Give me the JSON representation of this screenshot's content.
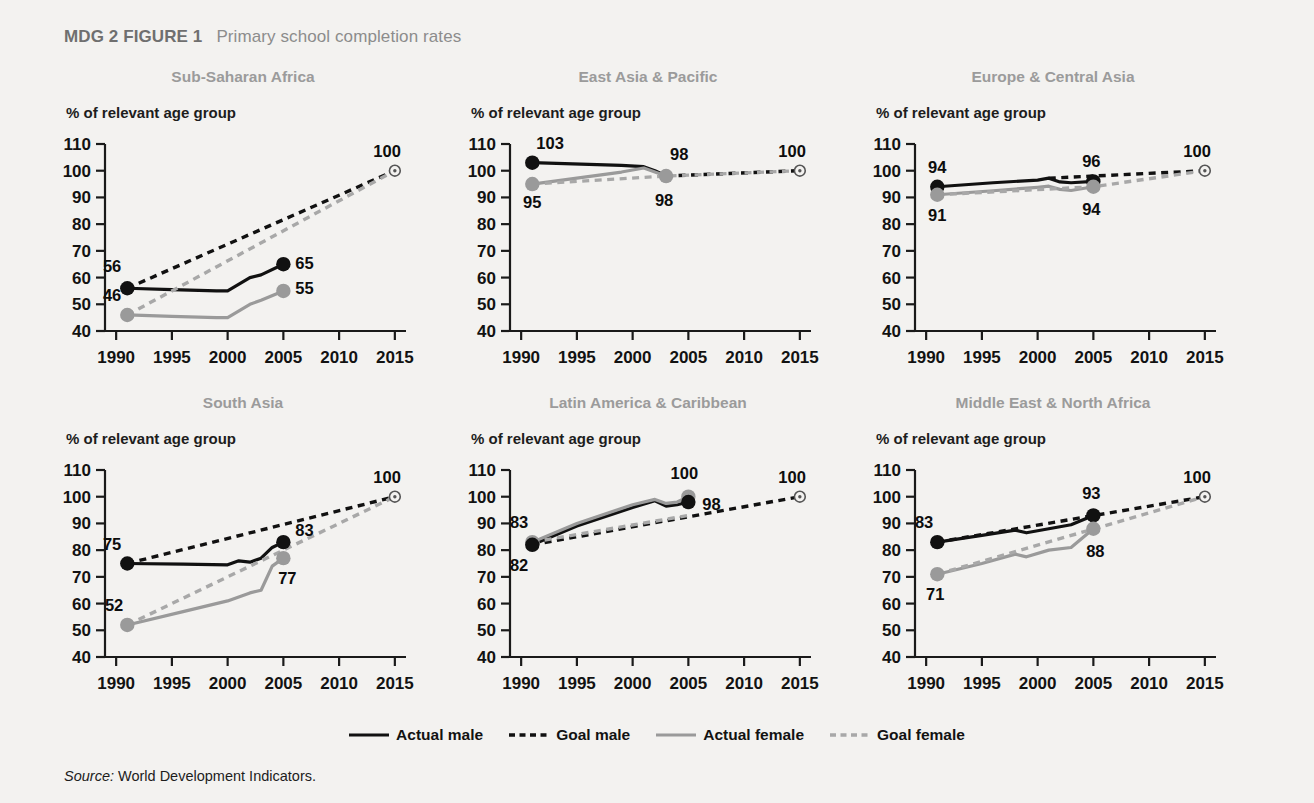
{
  "figure": {
    "number_label": "MDG 2 FIGURE 1",
    "title": "Primary school completion rates"
  },
  "source": {
    "label": "Source:",
    "text": "World Development Indicators."
  },
  "legend": {
    "position": "bottom-center",
    "items": [
      {
        "label": "Actual male",
        "color": "#111111",
        "style": "solid"
      },
      {
        "label": "Goal male",
        "color": "#111111",
        "style": "dashed"
      },
      {
        "label": "Actual female",
        "color": "#9a9a9a",
        "style": "solid"
      },
      {
        "label": "Goal female",
        "color": "#a8a8a8",
        "style": "dashed"
      }
    ]
  },
  "axes": {
    "ylabel": "% of relevant age group",
    "yticks": [
      110,
      100,
      90,
      80,
      70,
      60,
      50,
      40
    ],
    "ylim": [
      40,
      110
    ],
    "xticks": [
      1990,
      1995,
      2000,
      2005,
      2010,
      2015
    ],
    "xlim": [
      1989,
      2016
    ],
    "grid": false
  },
  "chart_data": [
    {
      "type": "line",
      "title": "Sub-Saharan Africa",
      "xlabel": "",
      "ylabel": "% of relevant age group",
      "ylim": [
        40,
        110
      ],
      "xlim": [
        1989,
        2016
      ],
      "series": [
        {
          "name": "Actual male",
          "style": "solid",
          "color": "#111111",
          "x": [
            1991,
            1995,
            1999,
            2000,
            2002,
            2003,
            2005
          ],
          "y": [
            56,
            55.5,
            55,
            55,
            60,
            61,
            65
          ]
        },
        {
          "name": "Goal male",
          "style": "dashed",
          "color": "#111111",
          "x": [
            1991,
            2015
          ],
          "y": [
            56,
            100
          ]
        },
        {
          "name": "Actual female",
          "style": "solid",
          "color": "#9a9a9a",
          "x": [
            1991,
            1995,
            1999,
            2000,
            2002,
            2003,
            2005
          ],
          "y": [
            46,
            45.5,
            45,
            45,
            50,
            51.5,
            55
          ]
        },
        {
          "name": "Goal female",
          "style": "dashed",
          "color": "#a8a8a8",
          "x": [
            1991,
            2015
          ],
          "y": [
            46,
            100
          ]
        }
      ],
      "point_labels": [
        {
          "text": "56",
          "x": 1991,
          "y": 56,
          "dx": -6,
          "dy": -16,
          "anchor": "end"
        },
        {
          "text": "65",
          "x": 2005,
          "y": 65,
          "dx": 12,
          "dy": 5,
          "anchor": "start"
        },
        {
          "text": "46",
          "x": 1991,
          "y": 46,
          "dx": -6,
          "dy": -14,
          "anchor": "end"
        },
        {
          "text": "55",
          "x": 2005,
          "y": 55,
          "dx": 12,
          "dy": 3,
          "anchor": "start"
        },
        {
          "text": "100",
          "x": 2015,
          "y": 100,
          "dx": 6,
          "dy": -14,
          "anchor": "end"
        }
      ],
      "markers": [
        {
          "x": 1991,
          "y": 56,
          "color": "#111111",
          "kind": "filled"
        },
        {
          "x": 2005,
          "y": 65,
          "color": "#111111",
          "kind": "filled"
        },
        {
          "x": 1991,
          "y": 46,
          "color": "#9a9a9a",
          "kind": "filled"
        },
        {
          "x": 2005,
          "y": 55,
          "color": "#9a9a9a",
          "kind": "filled"
        },
        {
          "x": 2015,
          "y": 100,
          "color": "#555555",
          "kind": "target"
        }
      ]
    },
    {
      "type": "line",
      "title": "East Asia & Pacific",
      "xlabel": "",
      "ylabel": "% of relevant age group",
      "ylim": [
        40,
        110
      ],
      "xlim": [
        1989,
        2016
      ],
      "series": [
        {
          "name": "Actual male",
          "style": "solid",
          "color": "#111111",
          "x": [
            1991,
            1999,
            2001,
            2002,
            2003
          ],
          "y": [
            103,
            102,
            101.5,
            100,
            98
          ]
        },
        {
          "name": "Goal male",
          "style": "dashed",
          "color": "#111111",
          "x": [
            2003,
            2015
          ],
          "y": [
            98,
            100
          ]
        },
        {
          "name": "Actual female",
          "style": "solid",
          "color": "#9a9a9a",
          "x": [
            1991,
            1999,
            2001,
            2003
          ],
          "y": [
            95,
            99.5,
            101,
            98
          ]
        },
        {
          "name": "Goal female",
          "style": "dashed",
          "color": "#a8a8a8",
          "x": [
            1991,
            2003,
            2015
          ],
          "y": [
            95,
            98,
            100
          ]
        }
      ],
      "point_labels": [
        {
          "text": "103",
          "x": 1991,
          "y": 103,
          "dx": 4,
          "dy": -14,
          "anchor": "start"
        },
        {
          "text": "95",
          "x": 1991,
          "y": 95,
          "dx": 0,
          "dy": 24,
          "anchor": "middle"
        },
        {
          "text": "98",
          "x": 2003,
          "y": 101,
          "dx": 4,
          "dy": -8,
          "anchor": "start"
        },
        {
          "text": "98",
          "x": 2003,
          "y": 98,
          "dx": -2,
          "dy": 30,
          "anchor": "middle"
        },
        {
          "text": "100",
          "x": 2015,
          "y": 100,
          "dx": 6,
          "dy": -14,
          "anchor": "end"
        }
      ],
      "markers": [
        {
          "x": 1991,
          "y": 103,
          "color": "#111111",
          "kind": "filled"
        },
        {
          "x": 1991,
          "y": 95,
          "color": "#9a9a9a",
          "kind": "filled"
        },
        {
          "x": 2003,
          "y": 98,
          "color": "#9a9a9a",
          "kind": "filled"
        },
        {
          "x": 2015,
          "y": 100,
          "color": "#555555",
          "kind": "target"
        }
      ]
    },
    {
      "type": "line",
      "title": "Europe & Central Asia",
      "xlabel": "",
      "ylabel": "% of relevant age group",
      "ylim": [
        40,
        110
      ],
      "xlim": [
        1989,
        2016
      ],
      "series": [
        {
          "name": "Actual male",
          "style": "solid",
          "color": "#111111",
          "x": [
            1991,
            1996,
            2000,
            2001,
            2002,
            2003,
            2005
          ],
          "y": [
            94,
            95.5,
            96.5,
            97.2,
            95.8,
            95.5,
            96
          ]
        },
        {
          "name": "Goal male",
          "style": "dashed",
          "color": "#111111",
          "x": [
            2001,
            2015
          ],
          "y": [
            97.2,
            100
          ]
        },
        {
          "name": "Actual female",
          "style": "solid",
          "color": "#9a9a9a",
          "x": [
            1991,
            1996,
            2000,
            2001,
            2002,
            2003,
            2005
          ],
          "y": [
            91,
            92.5,
            93.8,
            94.2,
            93,
            92.6,
            94
          ]
        },
        {
          "name": "Goal female",
          "style": "dashed",
          "color": "#a8a8a8",
          "x": [
            1991,
            2005,
            2015
          ],
          "y": [
            91,
            94,
            100
          ]
        }
      ],
      "point_labels": [
        {
          "text": "94",
          "x": 1991,
          "y": 94,
          "dx": 0,
          "dy": -14,
          "anchor": "middle"
        },
        {
          "text": "91",
          "x": 1991,
          "y": 91,
          "dx": 0,
          "dy": 26,
          "anchor": "middle"
        },
        {
          "text": "96",
          "x": 2005,
          "y": 96,
          "dx": -2,
          "dy": -14,
          "anchor": "middle"
        },
        {
          "text": "94",
          "x": 2005,
          "y": 94,
          "dx": -2,
          "dy": 28,
          "anchor": "middle"
        },
        {
          "text": "100",
          "x": 2015,
          "y": 100,
          "dx": 6,
          "dy": -14,
          "anchor": "end"
        }
      ],
      "markers": [
        {
          "x": 1991,
          "y": 94,
          "color": "#111111",
          "kind": "filled"
        },
        {
          "x": 1991,
          "y": 91,
          "color": "#9a9a9a",
          "kind": "filled"
        },
        {
          "x": 2005,
          "y": 96,
          "color": "#111111",
          "kind": "filled"
        },
        {
          "x": 2005,
          "y": 94,
          "color": "#9a9a9a",
          "kind": "filled"
        },
        {
          "x": 2015,
          "y": 100,
          "color": "#555555",
          "kind": "target"
        }
      ]
    },
    {
      "type": "line",
      "title": "South Asia",
      "xlabel": "",
      "ylabel": "% of relevant age group",
      "ylim": [
        40,
        110
      ],
      "xlim": [
        1989,
        2016
      ],
      "series": [
        {
          "name": "Actual male",
          "style": "solid",
          "color": "#111111",
          "x": [
            1991,
            1996,
            2000,
            2001,
            2002,
            2003,
            2004,
            2005
          ],
          "y": [
            75,
            74.8,
            74.5,
            76,
            75.5,
            77,
            81,
            83
          ]
        },
        {
          "name": "Goal male",
          "style": "dashed",
          "color": "#111111",
          "x": [
            1991,
            2015
          ],
          "y": [
            75,
            100
          ]
        },
        {
          "name": "Actual female",
          "style": "solid",
          "color": "#9a9a9a",
          "x": [
            1991,
            1996,
            2000,
            2002,
            2003,
            2004,
            2005
          ],
          "y": [
            52,
            57,
            61,
            64,
            65,
            74,
            77
          ]
        },
        {
          "name": "Goal female",
          "style": "dashed",
          "color": "#a8a8a8",
          "x": [
            1991,
            2015
          ],
          "y": [
            52,
            100
          ]
        }
      ],
      "point_labels": [
        {
          "text": "75",
          "x": 1991,
          "y": 75,
          "dx": -6,
          "dy": -14,
          "anchor": "end"
        },
        {
          "text": "52",
          "x": 1991,
          "y": 52,
          "dx": -4,
          "dy": -14,
          "anchor": "end"
        },
        {
          "text": "83",
          "x": 2005,
          "y": 83,
          "dx": 12,
          "dy": -6,
          "anchor": "start"
        },
        {
          "text": "77",
          "x": 2005,
          "y": 77,
          "dx": 4,
          "dy": 26,
          "anchor": "middle"
        },
        {
          "text": "100",
          "x": 2015,
          "y": 100,
          "dx": 6,
          "dy": -14,
          "anchor": "end"
        }
      ],
      "markers": [
        {
          "x": 1991,
          "y": 75,
          "color": "#111111",
          "kind": "filled"
        },
        {
          "x": 2005,
          "y": 83,
          "color": "#111111",
          "kind": "filled"
        },
        {
          "x": 1991,
          "y": 52,
          "color": "#9a9a9a",
          "kind": "filled"
        },
        {
          "x": 2005,
          "y": 77,
          "color": "#9a9a9a",
          "kind": "filled"
        },
        {
          "x": 2015,
          "y": 100,
          "color": "#555555",
          "kind": "target"
        }
      ]
    },
    {
      "type": "line",
      "title": "Latin America & Caribbean",
      "xlabel": "",
      "ylabel": "% of relevant age group",
      "ylim": [
        40,
        110
      ],
      "xlim": [
        1989,
        2016
      ],
      "series": [
        {
          "name": "Actual male",
          "style": "solid",
          "color": "#111111",
          "x": [
            1991,
            1995,
            2000,
            2002,
            2003,
            2004,
            2005
          ],
          "y": [
            82,
            89,
            96,
            98.5,
            96.5,
            97,
            98
          ]
        },
        {
          "name": "Goal male",
          "style": "dashed",
          "color": "#111111",
          "x": [
            1991,
            2015
          ],
          "y": [
            82,
            100
          ]
        },
        {
          "name": "Actual female",
          "style": "solid",
          "color": "#9a9a9a",
          "x": [
            1991,
            1995,
            2000,
            2002,
            2003,
            2004,
            2005
          ],
          "y": [
            83,
            90,
            97,
            99,
            97.5,
            98,
            100
          ]
        },
        {
          "name": "Goal female",
          "style": "dashed",
          "color": "#a8a8a8",
          "x": [
            1991,
            2005
          ],
          "y": [
            83,
            93
          ]
        }
      ],
      "point_labels": [
        {
          "text": "83",
          "x": 1991,
          "y": 83,
          "dx": -4,
          "dy": -14,
          "anchor": "end"
        },
        {
          "text": "82",
          "x": 1991,
          "y": 82,
          "dx": -4,
          "dy": 26,
          "anchor": "end"
        },
        {
          "text": "100",
          "x": 2005,
          "y": 100,
          "dx": -4,
          "dy": -18,
          "anchor": "middle"
        },
        {
          "text": "98",
          "x": 2005,
          "y": 98,
          "dx": 14,
          "dy": 8,
          "anchor": "start"
        },
        {
          "text": "100",
          "x": 2015,
          "y": 100,
          "dx": 6,
          "dy": -14,
          "anchor": "end"
        }
      ],
      "markers": [
        {
          "x": 1991,
          "y": 83,
          "color": "#9a9a9a",
          "kind": "filled"
        },
        {
          "x": 1991,
          "y": 82,
          "color": "#111111",
          "kind": "filled"
        },
        {
          "x": 2005,
          "y": 100,
          "color": "#9a9a9a",
          "kind": "filled"
        },
        {
          "x": 2005,
          "y": 98,
          "color": "#111111",
          "kind": "filled"
        },
        {
          "x": 2015,
          "y": 100,
          "color": "#555555",
          "kind": "target"
        }
      ]
    },
    {
      "type": "line",
      "title": "Middle East & North Africa",
      "xlabel": "",
      "ylabel": "% of relevant age group",
      "ylim": [
        40,
        110
      ],
      "xlim": [
        1989,
        2016
      ],
      "series": [
        {
          "name": "Actual male",
          "style": "solid",
          "color": "#111111",
          "x": [
            1991,
            1995,
            1998,
            1999,
            2001,
            2003,
            2005
          ],
          "y": [
            83,
            85.5,
            87.5,
            86.5,
            88,
            89.5,
            93
          ]
        },
        {
          "name": "Goal male",
          "style": "dashed",
          "color": "#111111",
          "x": [
            1991,
            2015
          ],
          "y": [
            83,
            100
          ]
        },
        {
          "name": "Actual female",
          "style": "solid",
          "color": "#9a9a9a",
          "x": [
            1991,
            1995,
            1998,
            1999,
            2001,
            2003,
            2005
          ],
          "y": [
            71,
            75,
            78.5,
            77.5,
            80,
            81,
            88
          ]
        },
        {
          "name": "Goal female",
          "style": "dashed",
          "color": "#a8a8a8",
          "x": [
            1991,
            2015
          ],
          "y": [
            71,
            100
          ]
        }
      ],
      "point_labels": [
        {
          "text": "83",
          "x": 1991,
          "y": 83,
          "dx": -4,
          "dy": -14,
          "anchor": "end"
        },
        {
          "text": "71",
          "x": 1991,
          "y": 71,
          "dx": -2,
          "dy": 26,
          "anchor": "middle"
        },
        {
          "text": "93",
          "x": 2005,
          "y": 93,
          "dx": -2,
          "dy": -16,
          "anchor": "middle"
        },
        {
          "text": "88",
          "x": 2005,
          "y": 88,
          "dx": 2,
          "dy": 28,
          "anchor": "middle"
        },
        {
          "text": "100",
          "x": 2015,
          "y": 100,
          "dx": 6,
          "dy": -14,
          "anchor": "end"
        }
      ],
      "markers": [
        {
          "x": 1991,
          "y": 83,
          "color": "#111111",
          "kind": "filled"
        },
        {
          "x": 1991,
          "y": 71,
          "color": "#9a9a9a",
          "kind": "filled"
        },
        {
          "x": 2005,
          "y": 93,
          "color": "#111111",
          "kind": "filled"
        },
        {
          "x": 2005,
          "y": 88,
          "color": "#9a9a9a",
          "kind": "filled"
        },
        {
          "x": 2015,
          "y": 100,
          "color": "#555555",
          "kind": "target"
        }
      ]
    }
  ]
}
